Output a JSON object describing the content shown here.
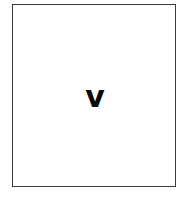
{
  "card": {
    "letter": "v",
    "border_color": "#3a3a3a",
    "text_color": "#0a0a0a",
    "background": "#ffffff"
  }
}
